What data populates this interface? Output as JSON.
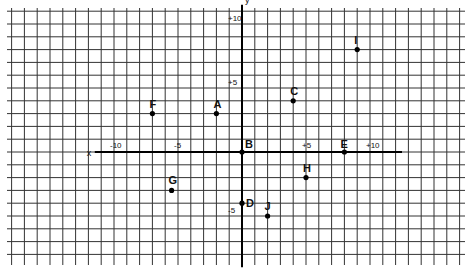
{
  "chart_data": {
    "type": "scatter",
    "title": "",
    "xlabel": "x",
    "ylabel": "y",
    "grid": true,
    "xlim": [
      -18,
      17
    ],
    "ylim": [
      -9,
      11
    ],
    "x_tick_labels": [
      {
        "value": -10,
        "label": "-10"
      },
      {
        "value": -5,
        "label": "-5"
      },
      {
        "value": 5,
        "label": "+5"
      },
      {
        "value": 10,
        "label": "+10"
      }
    ],
    "y_tick_labels": [
      {
        "value": 10,
        "label": "+10"
      },
      {
        "value": 5,
        "label": "+5"
      },
      {
        "value": -5,
        "label": "-5"
      }
    ],
    "points": [
      {
        "label": "A",
        "x": -2,
        "y": 3
      },
      {
        "label": "B",
        "x": 0,
        "y": 0
      },
      {
        "label": "C",
        "x": 4,
        "y": 4
      },
      {
        "label": "D",
        "x": 0,
        "y": -4
      },
      {
        "label": "E",
        "x": 8,
        "y": 0
      },
      {
        "label": "F",
        "x": -7,
        "y": 3
      },
      {
        "label": "G",
        "x": -5.5,
        "y": -3
      },
      {
        "label": "H",
        "x": 5,
        "y": -2
      },
      {
        "label": "I",
        "x": 9,
        "y": 8
      },
      {
        "label": "J",
        "x": 2,
        "y": -5
      }
    ]
  },
  "layout": {
    "origin_px": [
      242,
      152
    ],
    "unit_px": 12.8,
    "grid_box": [
      7,
      8,
      465,
      265
    ],
    "x_axis_extent": [
      -11.5,
      12.5
    ],
    "y_axis_extent": [
      -9,
      11.5
    ]
  }
}
